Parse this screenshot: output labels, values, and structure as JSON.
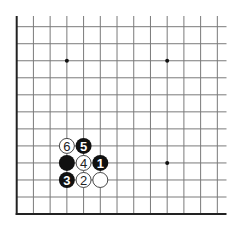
{
  "diagram": {
    "type": "go-board-fragment",
    "corner": "bottom-left",
    "colors": {
      "background": "#ffffff",
      "grid_line": "#7a7a7a",
      "edge_line": "#222222",
      "black_stone": "#111111",
      "white_stone": "#ffffff",
      "white_stone_outline": "#333333",
      "star_point": "#111111"
    },
    "grid": {
      "columns": 13,
      "rows": 12,
      "origin_x": 16.7,
      "origin_y": 26.7,
      "col_spacing": 16.72,
      "row_spacing": 17.03,
      "line_extent_right": 226.5,
      "left_edge_top": 16,
      "left_edge": true,
      "bottom_edge": true
    },
    "star_points": [
      {
        "col": 3,
        "row": 2
      },
      {
        "col": 9,
        "row": 2
      },
      {
        "col": 9,
        "row": 8
      }
    ],
    "stones": [
      {
        "color": "white",
        "col": 3,
        "row": 7,
        "label": "6"
      },
      {
        "color": "black",
        "col": 4,
        "row": 7,
        "label": "5"
      },
      {
        "color": "black",
        "col": 3,
        "row": 8,
        "label": ""
      },
      {
        "color": "white",
        "col": 4,
        "row": 8,
        "label": "4"
      },
      {
        "color": "black",
        "col": 5,
        "row": 8,
        "label": "1"
      },
      {
        "color": "black",
        "col": 3,
        "row": 9,
        "label": "3"
      },
      {
        "color": "white",
        "col": 4,
        "row": 9,
        "label": "2"
      },
      {
        "color": "white",
        "col": 5,
        "row": 9,
        "label": ""
      }
    ],
    "stone_radius": 8
  }
}
